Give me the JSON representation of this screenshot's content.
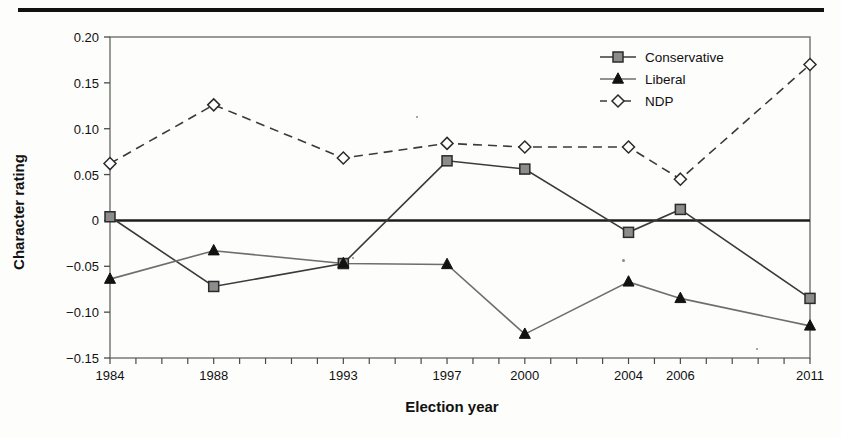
{
  "figure": {
    "separator_rule": "horizontal-rule"
  },
  "chart_data": {
    "type": "line",
    "title": "",
    "xlabel": "Election year",
    "ylabel": "Character rating",
    "x": [
      1984,
      1988,
      1993,
      1997,
      2000,
      2004,
      2006,
      2011
    ],
    "categories": [
      "1984",
      "1988",
      "1993",
      "1997",
      "2000",
      "2004",
      "2006",
      "2011"
    ],
    "xlim": [
      1984,
      2011
    ],
    "ylim": [
      -0.15,
      0.2
    ],
    "yticks": [
      0.2,
      0.15,
      0.1,
      0.05,
      0,
      -0.05,
      -0.1,
      -0.15
    ],
    "ytick_labels": [
      "0.20",
      "0.15",
      "0.10",
      "0.05",
      "0",
      "−0.05",
      "−0.10",
      "−0.15"
    ],
    "grid": false,
    "zero_line": true,
    "legend_position": "top-right",
    "series": [
      {
        "name": "Conservative",
        "marker": "square",
        "line_style": "solid",
        "color": "#7d7d7d",
        "values": [
          0.004,
          -0.072,
          -0.047,
          0.065,
          0.056,
          -0.013,
          0.012,
          -0.085
        ]
      },
      {
        "name": "Liberal",
        "marker": "triangle",
        "line_style": "solid",
        "color": "#111111",
        "values": [
          -0.064,
          -0.033,
          -0.047,
          -0.048,
          -0.124,
          -0.067,
          -0.085,
          -0.115
        ]
      },
      {
        "name": "NDP",
        "marker": "diamond",
        "line_style": "dashed",
        "color": "#ffffff",
        "values": [
          0.062,
          0.126,
          0.068,
          0.084,
          0.08,
          0.08,
          0.045,
          0.17
        ]
      }
    ]
  }
}
